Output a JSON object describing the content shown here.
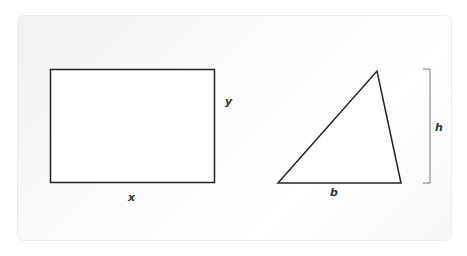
{
  "diagram": {
    "rectangle": {
      "width_label": "x",
      "height_label": "y"
    },
    "triangle": {
      "base_label": "b",
      "height_label": "h"
    },
    "colors": {
      "stroke": "#222222",
      "panel": "#f7f7f7"
    }
  }
}
